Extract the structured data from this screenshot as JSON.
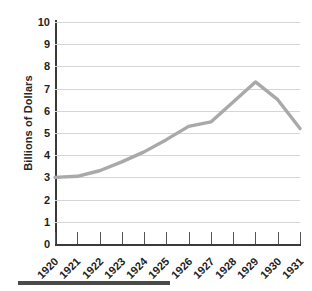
{
  "chart_data": {
    "type": "line",
    "title": "",
    "xlabel": "",
    "ylabel": "Billions of Dollars",
    "categories": [
      "1920",
      "1921",
      "1922",
      "1923",
      "1924",
      "1925",
      "1926",
      "1927",
      "1928",
      "1929",
      "1930",
      "1931"
    ],
    "values": [
      3.0,
      3.05,
      3.3,
      3.7,
      4.15,
      4.7,
      5.3,
      5.5,
      6.4,
      7.3,
      6.5,
      5.2
    ],
    "series": [
      {
        "name": "Billions of Dollars",
        "values": [
          3.0,
          3.05,
          3.3,
          3.7,
          4.15,
          4.7,
          5.3,
          5.5,
          6.4,
          7.3,
          6.5,
          5.2
        ]
      }
    ],
    "ylim": [
      0,
      10
    ],
    "y_ticks": [
      0,
      1,
      2,
      3,
      4,
      5,
      6,
      7,
      8,
      9,
      10
    ],
    "y_tick_labels": [
      "0",
      "1",
      "2",
      "3",
      "4",
      "5",
      "6",
      "7",
      "8",
      "9",
      "10"
    ],
    "grid": true,
    "legend": "none",
    "line_color": "#a9a9a9",
    "axis_color": "#3a3a3a",
    "grid_color": "#d5d5d5"
  },
  "axes": {
    "y_title": "Billions of Dollars"
  },
  "colors": {
    "line": "#a9a9a9",
    "axis": "#3a3a3a",
    "grid": "#d5d5d5",
    "text": "#1f1f1f",
    "rule": "#4a4a4a",
    "background": "#ffffff"
  }
}
